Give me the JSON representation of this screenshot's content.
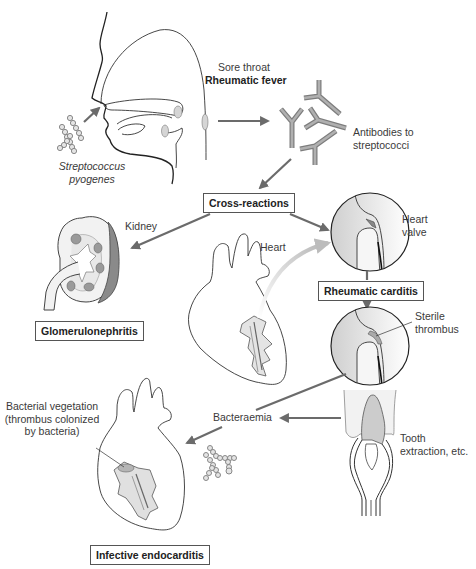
{
  "labels": {
    "organism_line1": "Streptococcus",
    "organism_line2": "pyogenes",
    "sore_throat": "Sore throat",
    "rheumatic_fever": "Rheumatic fever",
    "antibodies_line1": "Antibodies to",
    "antibodies_line2": "streptococci",
    "kidney": "Kidney",
    "heart": "Heart",
    "heart_valve_line1": "Heart",
    "heart_valve_line2": "valve",
    "sterile_line1": "Sterile",
    "sterile_line2": "thrombus",
    "bacteraemia": "Bacteraemia",
    "tooth_line1": "Tooth",
    "tooth_line2": "extraction, etc.",
    "vegetation_line1": "Bacterial vegetation",
    "vegetation_line2": "(thrombus colonized",
    "vegetation_line3": "by bacteria)"
  },
  "boxes": {
    "cross_reactions": "Cross-reactions",
    "rheumatic_carditis": "Rheumatic carditis",
    "glomerulonephritis": "Glomerulonephritis",
    "infective_endocarditis": "Infective endocarditis"
  },
  "flow": [
    {
      "from": "Streptococcus pyogenes",
      "to": "Sore throat / Rheumatic fever"
    },
    {
      "from": "Sore throat / Rheumatic fever",
      "to": "Antibodies to streptococci"
    },
    {
      "from": "Antibodies to streptococci",
      "to": "Cross-reactions"
    },
    {
      "from": "Cross-reactions",
      "to": "Kidney (Glomerulonephritis)"
    },
    {
      "from": "Cross-reactions",
      "to": "Heart valve"
    },
    {
      "from": "Heart",
      "to": "Heart valve"
    },
    {
      "from": "Heart valve",
      "to": "Rheumatic carditis"
    },
    {
      "from": "Rheumatic carditis",
      "to": "Sterile thrombus"
    },
    {
      "from": "Sterile thrombus",
      "to": "Bacteraemia"
    },
    {
      "from": "Tooth extraction, etc.",
      "to": "Bacteraemia"
    },
    {
      "from": "Bacteraemia",
      "to": "Infective endocarditis"
    }
  ],
  "colors": {
    "arrow": "#6b6b6b",
    "line": "#333333",
    "fill_gray": "#c8c8c8",
    "antibody": "#8e8e8e"
  }
}
